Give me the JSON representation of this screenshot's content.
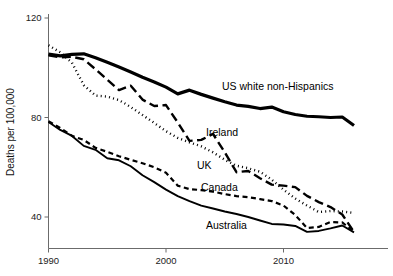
{
  "chart_data": {
    "type": "line",
    "title": "",
    "subtitle": "",
    "xlabel": "",
    "ylabel": "Deaths per 100,000",
    "xlim": [
      1990,
      2016
    ],
    "ylim": [
      28,
      120
    ],
    "xticks": [
      1990,
      2000,
      2010
    ],
    "xtick_labels": [
      "1990",
      "2000",
      "2010"
    ],
    "yticks": [
      40,
      80,
      120
    ],
    "ytick_labels": [
      "40",
      "80",
      "120"
    ],
    "grid": false,
    "legend_position": "inline-annotations",
    "x": [
      1990,
      1991,
      1992,
      1993,
      1994,
      1995,
      1996,
      1997,
      1998,
      1999,
      2000,
      2001,
      2002,
      2003,
      2004,
      2005,
      2006,
      2007,
      2008,
      2009,
      2010,
      2011,
      2012,
      2013,
      2014,
      2015,
      2016
    ],
    "series": [
      {
        "name": "US white non-Hispanics",
        "style": "solid-thick",
        "stroke_width": 3.2,
        "dash": "none",
        "label": "US white non-Hispanics",
        "label_x": 222,
        "label_y": 90,
        "values": [
          105.5,
          104.8,
          105.4,
          105.6,
          104.0,
          102.2,
          100.3,
          98.3,
          96.2,
          94.3,
          92.2,
          89.5,
          91.0,
          89.3,
          87.8,
          86.3,
          85.0,
          84.5,
          83.6,
          84.2,
          82.3,
          81.2,
          80.5,
          80.3,
          80.0,
          80.2,
          76.8
        ]
      },
      {
        "name": "Ireland",
        "style": "long-dash",
        "stroke_width": 2.4,
        "dash": "9 4.5",
        "label": "Ireland",
        "label_x": 206,
        "label_y": 136,
        "values": [
          105.0,
          104.2,
          104.4,
          103.4,
          99.4,
          95.2,
          91.0,
          92.8,
          87.2,
          84.6,
          85.0,
          78.0,
          70.6,
          71.0,
          73.4,
          66.0,
          58.0,
          58.5,
          55.6,
          53.0,
          52.6,
          52.0,
          48.5,
          46.0,
          44.0,
          41.0,
          34.0
        ]
      },
      {
        "name": "UK",
        "style": "dotted",
        "stroke_width": 2.4,
        "dash": "1 3.2",
        "label": "UK",
        "label_x": 197,
        "label_y": 169,
        "values": [
          109.0,
          106.2,
          102.0,
          93.0,
          88.8,
          88.4,
          87.0,
          84.2,
          81.0,
          77.8,
          74.5,
          71.8,
          70.0,
          68.4,
          66.0,
          63.0,
          60.6,
          59.6,
          58.2,
          55.0,
          51.0,
          47.4,
          44.6,
          42.0,
          42.4,
          42.2,
          41.6
        ]
      },
      {
        "name": "Canada",
        "style": "short-dash",
        "stroke_width": 2.2,
        "dash": "5 3.5",
        "label": "Canada",
        "label_x": 201,
        "label_y": 191,
        "values": [
          78.5,
          75.8,
          72.6,
          71.0,
          67.8,
          66.2,
          64.4,
          63.0,
          61.6,
          60.0,
          57.8,
          52.6,
          51.2,
          50.8,
          50.2,
          49.2,
          48.4,
          48.0,
          47.2,
          46.4,
          44.6,
          40.8,
          35.6,
          36.0,
          38.0,
          37.8,
          34.0
        ]
      },
      {
        "name": "Australia",
        "style": "solid-thin",
        "stroke_width": 1.9,
        "dash": "none",
        "label": "Australia",
        "label_x": 206,
        "label_y": 229,
        "values": [
          78.2,
          75.0,
          72.6,
          68.6,
          67.0,
          63.6,
          62.8,
          60.4,
          56.8,
          54.0,
          51.0,
          48.4,
          46.4,
          44.6,
          43.4,
          42.2,
          41.2,
          40.0,
          38.6,
          37.2,
          37.0,
          36.4,
          34.0,
          34.4,
          35.4,
          36.6,
          33.8
        ]
      }
    ]
  },
  "axes": {
    "y_axis_title": "Deaths per 100,000"
  }
}
